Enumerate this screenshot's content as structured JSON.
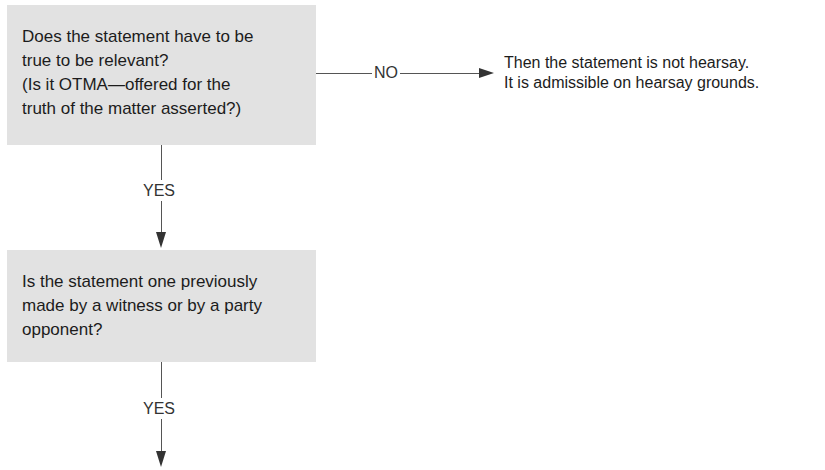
{
  "flowchart": {
    "nodes": [
      {
        "id": "q1",
        "type": "decision",
        "lines": [
          "Does the statement have to be",
          "true to be relevant?",
          "(Is it OTMA—offered for the",
          "truth of the matter asserted?)"
        ]
      },
      {
        "id": "q2",
        "type": "decision",
        "lines": [
          "Is the statement one previously",
          "made by a witness or by a party",
          "opponent?"
        ]
      }
    ],
    "outcomes": [
      {
        "id": "not-hearsay",
        "lines": [
          "Then the statement is not hearsay.",
          "It is admissible on hearsay grounds."
        ]
      }
    ],
    "edges": [
      {
        "from": "q1",
        "to": "not-hearsay",
        "label": "NO"
      },
      {
        "from": "q1",
        "to": "q2",
        "label": "YES"
      },
      {
        "from": "q2",
        "to": "continues-below",
        "label": "YES"
      }
    ]
  },
  "colors": {
    "box_fill": "#e2e2e2",
    "line": "#555555",
    "arrowhead": "#333333",
    "text": "#1c1c1c"
  }
}
